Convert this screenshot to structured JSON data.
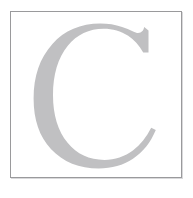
{
  "image": {
    "kind": "letter-tile",
    "description": "Large light-gray serif capital letter inside a thin gray square frame on a white background",
    "width_px": 193,
    "height_px": 198
  },
  "frame": {
    "name": "square-border",
    "border_color": "#9a9a9c",
    "border_width_px": 1,
    "shadow_color": "#d9d9db",
    "fill_color": "#ffffff",
    "left_px": 10,
    "top_px": 11,
    "width_px": 172,
    "height_px": 167
  },
  "glyph": {
    "character": "C",
    "name": "capital-letter-c",
    "style": "serif",
    "fill_color": "#c0c0c2",
    "bounds": {
      "left_px": 47,
      "top_px": 30,
      "right_px": 148,
      "bottom_px": 158
    }
  },
  "background": {
    "page_color": "#ffffff"
  }
}
